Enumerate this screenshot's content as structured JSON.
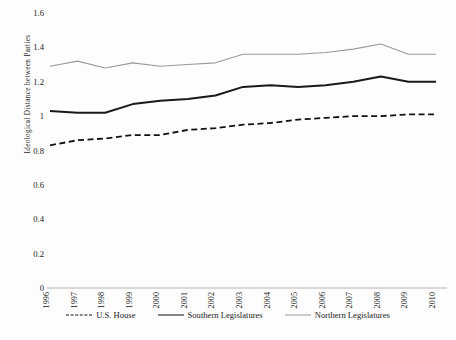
{
  "chart_data": {
    "type": "line",
    "title": "",
    "xlabel": "",
    "ylabel": "Ideological Distance between Parties",
    "x": [
      1996,
      1997,
      1998,
      1999,
      2000,
      2001,
      2002,
      2003,
      2004,
      2005,
      2006,
      2007,
      2008,
      2009,
      2010
    ],
    "categories": [
      "1996",
      "1997",
      "1998",
      "1999",
      "2000",
      "2001",
      "2002",
      "2003",
      "2004",
      "2005",
      "2006",
      "2007",
      "2008",
      "2009",
      "2010"
    ],
    "xlim": [
      1996,
      2010
    ],
    "ylim": [
      0,
      1.6
    ],
    "yticks": [
      "0",
      "0.2",
      "0.4",
      "0.6",
      "0.8",
      "1",
      "1.2",
      "1.4",
      "1.6"
    ],
    "ytick_values": [
      0,
      0.2,
      0.4,
      0.6,
      0.8,
      1.0,
      1.2,
      1.4,
      1.6
    ],
    "grid": false,
    "legend_position": "bottom",
    "series": [
      {
        "name": "U.S. House",
        "style": "dashed",
        "color": "#111111",
        "width": 1.8,
        "values": [
          0.83,
          0.86,
          0.87,
          0.89,
          0.89,
          0.92,
          0.93,
          0.95,
          0.96,
          0.98,
          0.99,
          1.0,
          1.0,
          1.01,
          1.01
        ]
      },
      {
        "name": "Southern Legislatures",
        "style": "solid",
        "color": "#1a1a1a",
        "width": 2.0,
        "values": [
          1.03,
          1.02,
          1.02,
          1.07,
          1.09,
          1.1,
          1.12,
          1.17,
          1.18,
          1.17,
          1.18,
          1.2,
          1.23,
          1.2,
          1.2
        ]
      },
      {
        "name": "Northern Legislatures",
        "style": "solid",
        "color": "#9a9a9a",
        "width": 1.1,
        "values": [
          1.29,
          1.32,
          1.28,
          1.31,
          1.29,
          1.3,
          1.31,
          1.36,
          1.36,
          1.36,
          1.37,
          1.39,
          1.42,
          1.36,
          1.36
        ]
      }
    ]
  },
  "axis": {
    "x_axis_color": "#b5b5b5",
    "y_title": "Ideological Distance between Parties"
  }
}
